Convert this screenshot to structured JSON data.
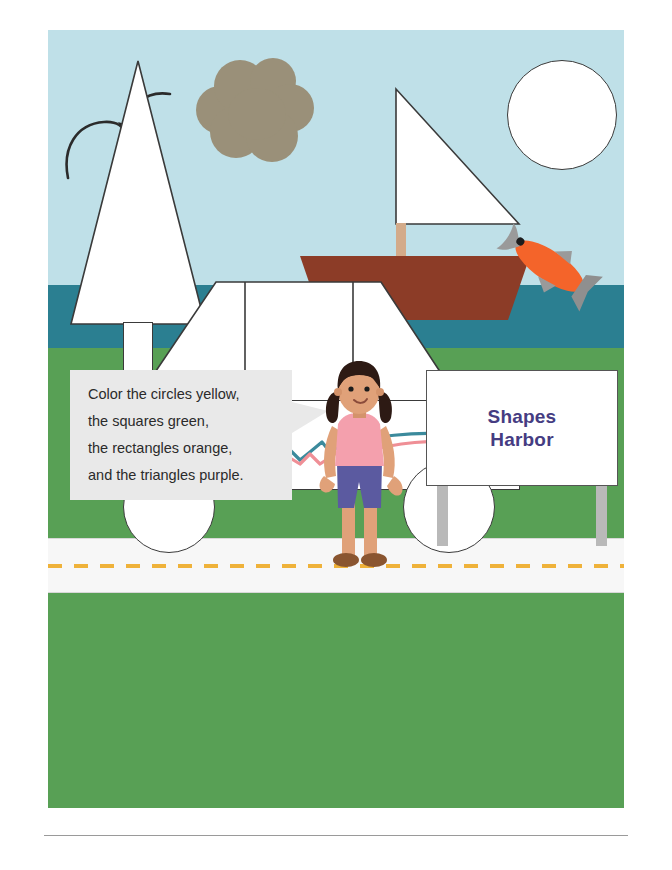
{
  "worksheet": {
    "title": "Shapes Harbor Coloring Worksheet",
    "page_background": "#ffffff"
  },
  "instructions": {
    "name": "color-instructions",
    "lines": [
      "Color the circles yellow,",
      "the squares green,",
      "the rectangles orange,",
      "and the triangles purple."
    ],
    "line1": "Color the circles yellow,",
    "line2": "the squares green,",
    "line3": "the rectangles orange,",
    "line4": "and the triangles purple.",
    "bubble_fill": "#e9e9e9",
    "text_color": "#2b2b2b"
  },
  "sign": {
    "name": "shapes-harbor-sign",
    "line1": "Shapes",
    "line2": "Harbor",
    "text": "Shapes Harbor",
    "text_color": "#453c82",
    "board_fill": "#ffffff",
    "post_color": "#b9b9b9"
  },
  "scene": {
    "bands": [
      {
        "name": "sky",
        "color": "#bfe0e8"
      },
      {
        "name": "water",
        "color": "#2b7f91"
      },
      {
        "name": "grass",
        "color": "#58a055"
      }
    ],
    "road": {
      "name": "road",
      "surface_color": "#f7f7f7",
      "center_line_color": "#efb23a",
      "center_line_style": "dashed"
    },
    "objects": [
      {
        "name": "seagull",
        "shape": "two-arcs",
        "color": "#2b2b2b"
      },
      {
        "name": "pine-tree",
        "shape": "triangle + rectangle trunk",
        "fill": "#ffffff",
        "outline": "#3a3a3a"
      },
      {
        "name": "cloud",
        "shape": "overlapping circles",
        "fill": "#9a9079"
      },
      {
        "name": "sailboat-sail",
        "shape": "right triangle",
        "fill": "#ffffff",
        "outline": "#3a3a3a"
      },
      {
        "name": "sailboat-mast",
        "shape": "rectangle",
        "fill": "#d3ab8a"
      },
      {
        "name": "sailboat-hull",
        "shape": "trapezoid",
        "fill": "#8c3c27"
      },
      {
        "name": "sun",
        "shape": "circle",
        "fill": "#ffffff",
        "outline": "#3a3a3a"
      },
      {
        "name": "fish",
        "shape": "jumping fish",
        "body": "#f4642a",
        "head": "#9a9a9a"
      },
      {
        "name": "car-cabin",
        "shape": "trapezoid with two windows",
        "fill": "#ffffff",
        "outline": "#3a3a3a"
      },
      {
        "name": "car-body",
        "shape": "rectangle",
        "fill": "#ffffff",
        "outline": "#3a3a3a"
      },
      {
        "name": "car-wheels",
        "shape": "two circles",
        "fill": "#ffffff",
        "outline": "#3a3a3a"
      },
      {
        "name": "car-stripes",
        "shape": "wavy lines",
        "colors": [
          "#3b8a9c",
          "#ef8f96"
        ]
      }
    ]
  },
  "girl": {
    "name": "girl-character",
    "hair_color": "#2d1a14",
    "skin_color": "#e0a179",
    "shirt_color": "#f4a0ad",
    "shorts_color": "#5b5aa0",
    "shoe_color": "#8a5530"
  }
}
